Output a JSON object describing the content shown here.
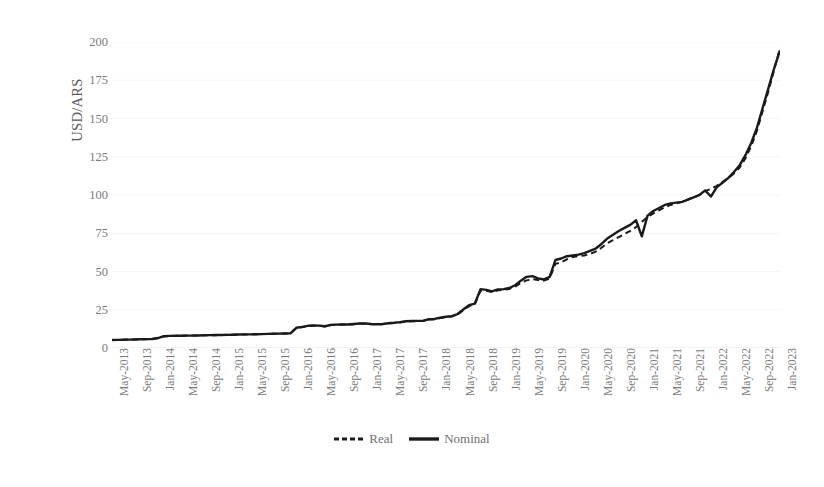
{
  "chart_data": {
    "type": "line",
    "title": "",
    "subtitle": "",
    "xlabel": "",
    "ylabel": "USD/ARS",
    "ylim": [
      0,
      200
    ],
    "yticks": [
      0,
      25,
      50,
      75,
      100,
      125,
      150,
      175,
      200
    ],
    "grid": "horizontal-faint",
    "legend_position": "bottom-center",
    "x_tick_labels": [
      "May-2013",
      "Sep-2013",
      "Jan-2014",
      "May-2014",
      "Sep-2014",
      "Jan-2015",
      "May-2015",
      "Sep-2015",
      "Jan-2016",
      "May-2016",
      "Sep-2016",
      "Jan-2017",
      "May-2017",
      "Sep-2017",
      "Jan-2018",
      "May-2018",
      "Sep-2018",
      "Jan-2019",
      "May-2019",
      "Sep-2019",
      "Jan-2020",
      "May-2020",
      "Sep-2020",
      "Jan-2021",
      "May-2021",
      "Sep-2021",
      "Jan-2022",
      "May-2022",
      "Sep-2022",
      "Jan-2023"
    ],
    "x_start": "May-2013",
    "x_end": "Jan-2023",
    "x_step_months": 1,
    "x_tick_step_months": 4,
    "series": [
      {
        "name": "Real",
        "style": "dashed",
        "color": "#1a1a1a",
        "values": [
          5.2,
          5.3,
          5.4,
          5.5,
          5.6,
          5.7,
          5.8,
          5.9,
          6.5,
          7.6,
          7.8,
          7.9,
          8.0,
          8.1,
          8.1,
          8.2,
          8.3,
          8.4,
          8.4,
          8.5,
          8.6,
          8.7,
          8.8,
          8.8,
          8.9,
          9.0,
          9.1,
          9.2,
          9.3,
          9.4,
          9.5,
          9.6,
          13.0,
          13.6,
          14.3,
          14.6,
          14.5,
          14.1,
          15.0,
          15.2,
          15.3,
          15.3,
          15.6,
          15.9,
          15.9,
          15.6,
          15.4,
          15.6,
          16.1,
          16.3,
          16.7,
          17.3,
          17.5,
          17.6,
          17.6,
          18.6,
          18.8,
          19.6,
          20.2,
          20.6,
          21.9,
          24.7,
          27.4,
          28.5,
          37.5,
          37.4,
          36.5,
          37.7,
          38.0,
          38.6,
          40.1,
          42.5,
          44.2,
          45.0,
          44.4,
          44.0,
          45.5,
          55.0,
          56.0,
          58.0,
          59.5,
          60.0,
          60.5,
          61.5,
          63.0,
          65.5,
          68.5,
          70.5,
          72.5,
          74.5,
          76.5,
          79.0,
          82.5,
          85.5,
          88.0,
          90.0,
          92.0,
          93.5,
          94.5,
          95.5,
          97.0,
          98.5,
          100.0,
          102.5,
          104.0,
          106.0,
          108.5,
          111.0,
          114.0,
          118.0,
          124.0,
          132.0,
          142.0,
          155.0,
          168.0,
          182.0,
          196.0
        ]
      },
      {
        "name": "Nominal",
        "style": "solid",
        "color": "#1a1a1a",
        "values": [
          5.2,
          5.3,
          5.4,
          5.5,
          5.6,
          5.7,
          5.8,
          5.9,
          6.5,
          7.7,
          7.9,
          8.0,
          8.0,
          8.1,
          8.1,
          8.2,
          8.3,
          8.4,
          8.5,
          8.5,
          8.6,
          8.7,
          8.8,
          8.9,
          8.9,
          9.0,
          9.1,
          9.2,
          9.3,
          9.4,
          9.5,
          9.6,
          13.2,
          13.8,
          14.5,
          14.8,
          14.6,
          14.2,
          15.1,
          15.3,
          15.4,
          15.4,
          15.7,
          16.0,
          16.0,
          15.7,
          15.5,
          15.7,
          16.2,
          16.5,
          16.9,
          17.5,
          17.6,
          17.7,
          17.7,
          18.8,
          19.0,
          19.8,
          20.4,
          20.8,
          22.2,
          25.2,
          28.0,
          29.0,
          38.5,
          38.0,
          37.0,
          38.3,
          38.5,
          39.2,
          41.0,
          44.0,
          46.5,
          47.0,
          45.5,
          44.8,
          46.5,
          57.5,
          58.5,
          60.0,
          60.5,
          61.0,
          62.0,
          63.5,
          65.0,
          68.0,
          71.5,
          74.0,
          76.5,
          78.5,
          80.5,
          83.5,
          73.0,
          86.5,
          89.5,
          91.5,
          93.5,
          94.5,
          95.0,
          95.5,
          97.0,
          98.5,
          100.0,
          103.0,
          99.0,
          105.0,
          108.0,
          111.0,
          115.0,
          119.5,
          126.0,
          134.0,
          144.0,
          157.0,
          170.0,
          183.0,
          194.5
        ]
      }
    ]
  },
  "legend": {
    "items": [
      {
        "label": "Real",
        "style": "dashed"
      },
      {
        "label": "Nominal",
        "style": "solid"
      }
    ]
  },
  "axes": {
    "y_title": "USD/ARS",
    "y_tick_labels": [
      "200",
      "175",
      "150",
      "125",
      "100",
      "75",
      "50",
      "25",
      "0"
    ]
  },
  "colors": {
    "line": "#1a1a1a",
    "tick_text": "#7a7a7a",
    "axis_title": "#5a5a5a",
    "gridline": "#f2f2f2",
    "background": "#ffffff"
  }
}
